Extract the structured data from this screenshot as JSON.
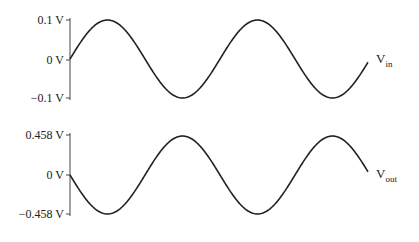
{
  "top_plot": {
    "signal_name": "V",
    "signal_sub": "in",
    "y_ticks": [
      "0.1 V",
      "0 V",
      "−0.1 V"
    ],
    "amplitude_v": 0.1
  },
  "bottom_plot": {
    "signal_name": "V",
    "signal_sub": "out",
    "y_ticks": [
      "0.458 V",
      "0 V",
      "−0.458 V"
    ],
    "amplitude_v": 0.458
  },
  "chart_data": [
    {
      "type": "line",
      "title": "Vin",
      "ylim": [
        -0.1,
        0.1
      ],
      "y_ticks": [
        "0.1 V",
        "0 V",
        "-0.1 V"
      ],
      "description": "sine wave, ~2 cycles, starts at 0 rising",
      "amplitude": 0.1,
      "phase_deg": 0
    },
    {
      "type": "line",
      "title": "Vout",
      "ylim": [
        -0.458,
        0.458
      ],
      "y_ticks": [
        "0.458 V",
        "0 V",
        "-0.458 V"
      ],
      "description": "inverted sine wave, ~2 cycles, starts at 0 falling",
      "amplitude": 0.458,
      "phase_deg": 180
    }
  ]
}
